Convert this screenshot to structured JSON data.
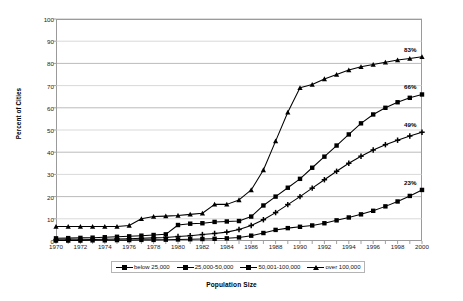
{
  "chart_data": {
    "type": "line",
    "title": "",
    "xlabel": "Population Size",
    "ylabel": "Percent of Cities",
    "xlim": [
      1970,
      2000
    ],
    "ylim": [
      0,
      100
    ],
    "ytick_step": 10,
    "xtick_label_step": 2,
    "grid": "horizontal",
    "legend_position": "bottom",
    "yticks": [
      0,
      10,
      20,
      30,
      40,
      50,
      60,
      70,
      80,
      90,
      100
    ],
    "ytick_labels": [
      "0",
      "10",
      "20",
      "30",
      "40",
      "50",
      "60",
      "70",
      "80",
      "90",
      "100"
    ],
    "x": [
      1970,
      1971,
      1972,
      1973,
      1974,
      1975,
      1976,
      1977,
      1978,
      1979,
      1980,
      1981,
      1982,
      1983,
      1984,
      1985,
      1986,
      1987,
      1988,
      1989,
      1990,
      1991,
      1992,
      1993,
      1994,
      1995,
      1996,
      1997,
      1998,
      1999,
      2000
    ],
    "xtick_labels": [
      "1970",
      "1972",
      "1974",
      "1976",
      "1978",
      "1980",
      "1982",
      "1984",
      "1986",
      "1988",
      "1990",
      "1992",
      "1994",
      "1996",
      "1998",
      "2000"
    ],
    "series": [
      {
        "name": "below 25,000",
        "marker": "square",
        "endpoint_label": "23%",
        "values": [
          0.2,
          0.2,
          0.2,
          0.3,
          0.3,
          0.4,
          0.4,
          0.5,
          0.5,
          0.6,
          0.7,
          0.8,
          0.9,
          1.0,
          1.2,
          1.6,
          2.4,
          3.6,
          5.0,
          5.8,
          6.4,
          7.0,
          8.0,
          9.3,
          10.6,
          12.0,
          13.6,
          15.6,
          17.8,
          20.3,
          23.0
        ]
      },
      {
        "name": "25,000-50,000",
        "marker": "plus",
        "endpoint_label": "49%",
        "values": [
          0.5,
          0.6,
          0.6,
          0.7,
          0.8,
          0.9,
          1.0,
          1.2,
          1.4,
          1.6,
          2.0,
          2.4,
          2.9,
          3.4,
          4.0,
          5.2,
          7.0,
          9.6,
          12.8,
          16.4,
          20.0,
          23.8,
          27.6,
          31.4,
          35.0,
          38.2,
          41.0,
          43.4,
          45.4,
          47.3,
          49.0
        ]
      },
      {
        "name": "50,001-100,000",
        "marker": "square",
        "endpoint_label": "66%",
        "values": [
          1.2,
          1.3,
          1.4,
          1.5,
          1.7,
          1.9,
          2.1,
          2.4,
          2.7,
          3.0,
          7.2,
          7.8,
          8.0,
          8.6,
          8.8,
          9.0,
          11.0,
          16.0,
          20.0,
          24.0,
          28.0,
          33.0,
          38.0,
          43.0,
          48.0,
          53.0,
          57.0,
          60.0,
          62.5,
          64.5,
          66.0
        ]
      },
      {
        "name": "over 100,000",
        "marker": "triangle",
        "endpoint_label": "83%",
        "values": [
          6.5,
          6.5,
          6.5,
          6.5,
          6.5,
          6.5,
          7.0,
          10.0,
          11.0,
          11.2,
          11.5,
          12.0,
          12.5,
          16.5,
          16.5,
          18.5,
          23.0,
          32.0,
          45.0,
          58.0,
          69.0,
          70.5,
          73.0,
          75.0,
          77.0,
          78.5,
          79.5,
          80.5,
          81.5,
          82.2,
          83.0
        ]
      }
    ]
  }
}
